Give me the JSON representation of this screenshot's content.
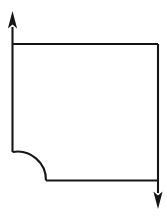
{
  "figure": {
    "background_color": "#ffffff",
    "stroke_color": "#161616",
    "stroke_width": 2.1,
    "canvas": {
      "width": 167,
      "height": 221
    }
  },
  "chart_data": {
    "type": "line",
    "xlabel": "",
    "ylabel": "",
    "grid": false,
    "legend": null,
    "xlim": [
      0,
      167
    ],
    "ylim": [
      0,
      221
    ],
    "annotations": [],
    "series": [
      {
        "name": "top-edge",
        "kind": "segment",
        "points": [
          [
            12.5,
            44.0
          ],
          [
            158.0,
            44.0
          ]
        ]
      },
      {
        "name": "right-edge",
        "kind": "segment",
        "points": [
          [
            158.0,
            44.0
          ],
          [
            158.0,
            180.5
          ]
        ]
      },
      {
        "name": "bottom-edge",
        "kind": "segment",
        "points": [
          [
            158.0,
            180.5
          ],
          [
            46.0,
            180.5
          ]
        ]
      },
      {
        "name": "corner-arc",
        "kind": "arc",
        "center": [
          46.0,
          152.0
        ],
        "radius": 28.5,
        "start_angle_deg": 90,
        "end_angle_deg": 180,
        "sweep": "concave-inward",
        "points": [
          [
            46.0,
            180.5
          ],
          [
            12.5,
            152.0
          ]
        ]
      },
      {
        "name": "left-edge",
        "kind": "segment",
        "points": [
          [
            12.5,
            152.0
          ],
          [
            12.5,
            44.0
          ]
        ]
      },
      {
        "name": "up-axis-stem",
        "kind": "segment",
        "points": [
          [
            12.5,
            44.0
          ],
          [
            12.5,
            20.0
          ]
        ]
      },
      {
        "name": "down-axis-stem",
        "kind": "segment",
        "points": [
          [
            158.0,
            180.5
          ],
          [
            158.0,
            197.0
          ]
        ]
      }
    ],
    "markers": [
      {
        "name": "up-arrowhead",
        "shape": "triangle",
        "direction": "up",
        "tip": [
          12.5,
          11.0
        ],
        "base_half_width": 4.6,
        "base_y": 27.0
      },
      {
        "name": "down-arrowhead",
        "shape": "triangle",
        "direction": "down",
        "tip": [
          158.0,
          209.0
        ],
        "base_half_width": 4.6,
        "base_y": 193.0
      }
    ]
  },
  "labels": {
    "up_arrow": "up-arrow",
    "down_arrow": "down-arrow",
    "arc": "quarter-circle-fillet",
    "outline": "rectangular-outline"
  }
}
